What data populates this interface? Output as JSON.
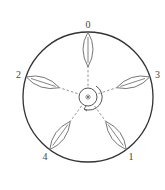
{
  "diagram": {
    "title": "",
    "leaves": [
      {
        "label": "0",
        "angle_deg": 0
      },
      {
        "label": "1",
        "angle_deg": 144
      },
      {
        "label": "2",
        "angle_deg": 288
      },
      {
        "label": "3",
        "angle_deg": 72
      },
      {
        "label": "4",
        "angle_deg": 216
      }
    ],
    "divergence": "2/5",
    "colors": {
      "line": "#555555",
      "outline": "#333333",
      "background": "#ffffff"
    }
  }
}
